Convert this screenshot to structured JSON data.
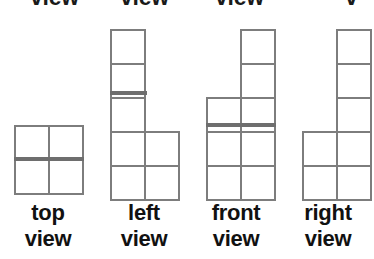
{
  "page": {
    "width": 374,
    "height": 259,
    "background_color": "#ffffff",
    "line_color": "#7d7d7d",
    "line_color_strong": "#6e6e6e",
    "text_color": "#111111",
    "cell_size": 34
  },
  "clipped_top_row": {
    "note": "bottom edges of a previous row of labels, cropped off at the top of the image",
    "words": [
      "view",
      "view",
      "view",
      "v"
    ]
  },
  "views": [
    {
      "id": "top-view",
      "label_line1": "top",
      "label_line2": "view",
      "label_left": 2,
      "origin_x": 14,
      "origin_y": 125,
      "columns": 2,
      "rows": 2,
      "cells": [
        {
          "col": 0,
          "row": 0
        },
        {
          "col": 1,
          "row": 0
        },
        {
          "col": 0,
          "row": 1
        },
        {
          "col": 1,
          "row": 1
        }
      ],
      "strong_edges": [
        {
          "type": "horizontal",
          "x": 14,
          "y": 157,
          "length": 68
        }
      ]
    },
    {
      "id": "left-view",
      "label_line1": "left",
      "label_line2": "view",
      "label_left": 98,
      "origin_x": 110,
      "origin_y": 29,
      "columns": 2,
      "rows": 5,
      "cells": [
        {
          "col": 0,
          "row": 0
        },
        {
          "col": 0,
          "row": 1
        },
        {
          "col": 0,
          "row": 2
        },
        {
          "col": 0,
          "row": 3
        },
        {
          "col": 1,
          "row": 3
        },
        {
          "col": 0,
          "row": 4
        },
        {
          "col": 1,
          "row": 4
        }
      ],
      "strong_edges": [
        {
          "type": "horizontal",
          "x": 110,
          "y": 91,
          "length": 35
        }
      ]
    },
    {
      "id": "front-view",
      "label_line1": "front",
      "label_line2": "view",
      "label_left": 190,
      "origin_x": 206,
      "origin_y": 29,
      "columns": 2,
      "rows": 5,
      "cells": [
        {
          "col": 1,
          "row": 0
        },
        {
          "col": 1,
          "row": 1
        },
        {
          "col": 0,
          "row": 2
        },
        {
          "col": 1,
          "row": 2
        },
        {
          "col": 0,
          "row": 3
        },
        {
          "col": 1,
          "row": 3
        },
        {
          "col": 0,
          "row": 4
        },
        {
          "col": 1,
          "row": 4
        }
      ],
      "strong_edges": [
        {
          "type": "horizontal",
          "x": 206,
          "y": 123,
          "length": 68
        }
      ]
    },
    {
      "id": "right-view",
      "label_line1": "right",
      "label_line2": "view",
      "label_left": 282,
      "origin_x": 302,
      "origin_y": 29,
      "columns": 2,
      "rows": 5,
      "cells": [
        {
          "col": 1,
          "row": 0
        },
        {
          "col": 1,
          "row": 1
        },
        {
          "col": 1,
          "row": 2
        },
        {
          "col": 0,
          "row": 3
        },
        {
          "col": 1,
          "row": 3
        },
        {
          "col": 0,
          "row": 4
        },
        {
          "col": 1,
          "row": 4
        }
      ],
      "strong_edges": []
    }
  ]
}
